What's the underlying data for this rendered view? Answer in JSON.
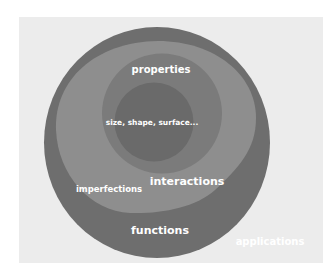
{
  "diagram": {
    "layers": [
      {
        "id": "applications",
        "label": "applications",
        "color": "#ffffff",
        "label_x": 270,
        "label_y": 241,
        "font_size": 10
      },
      {
        "id": "functions",
        "label": "functions",
        "color": "#6e6e6e",
        "label_x": 160,
        "label_y": 230,
        "font_size": 11
      },
      {
        "id": "interactions",
        "label": "interactions",
        "color": "#8e8e8e",
        "label_x": 187,
        "label_y": 181,
        "font_size": 11
      },
      {
        "id": "imperfections",
        "label": "imperfections",
        "color": "#8e8e8e",
        "label_x": 109,
        "label_y": 189,
        "font_size": 8.5
      },
      {
        "id": "properties",
        "label": "properties",
        "color": "#7b7b7b",
        "label_x": 161,
        "label_y": 69,
        "font_size": 10
      },
      {
        "id": "core",
        "label": "size, shape, surface...",
        "color": "#6a6a6a",
        "label_x": 152,
        "label_y": 122,
        "font_size": 7.5
      }
    ],
    "background_color": "#ececec"
  }
}
